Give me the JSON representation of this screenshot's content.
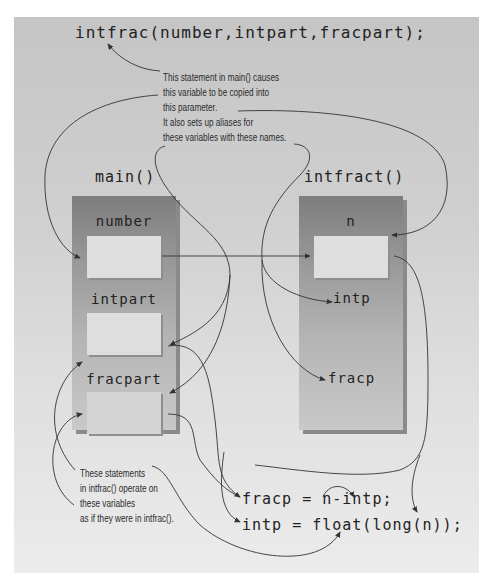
{
  "statement_call": "intfrac(number,intpart,fracpart);",
  "annotation_top": {
    "lines": [
      "This statement in main() causes",
      "this variable to be copied into",
      "this parameter.",
      "It also sets up aliases for",
      "these variables with these names."
    ]
  },
  "frames": {
    "main": {
      "title": "main()",
      "vars": [
        "number",
        "intpart",
        "fracpart"
      ]
    },
    "intfract": {
      "title": "intfract()",
      "vars": [
        "n",
        "intp",
        "fracp"
      ]
    }
  },
  "annotation_bottom": {
    "lines": [
      "These statements",
      "in intfrac() operate on",
      "these variables",
      "as if they were in intfrac()."
    ]
  },
  "statements": [
    "fracp = n-intp;",
    "intp = float(long(n));"
  ],
  "colors": {
    "panel_top": "#c5c5c5",
    "panel_bottom": "#ececec",
    "frame_dark": "#7d7d7d",
    "cell": "#dedede",
    "line": "#333333"
  }
}
